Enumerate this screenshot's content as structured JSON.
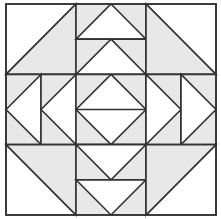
{
  "diagram": {
    "type": "quilt-block",
    "grid": {
      "rows": 3,
      "cols": 3
    },
    "origin": {
      "x": 6,
      "y": 4
    },
    "cell_size": {
      "w": 70,
      "h": 70.33
    },
    "colors": {
      "background": "#ffffff",
      "fill_light": "#ffffff",
      "fill_shaded": "#e8e8e8",
      "stroke": "#333333"
    },
    "stroke_width": 1.6,
    "cells": [
      {
        "row": 0,
        "col": 0,
        "kind": "half-square-triangle",
        "shaded_half": "bottom-right"
      },
      {
        "row": 0,
        "col": 1,
        "kind": "flying-geese-stack",
        "orientation": "vertical",
        "point": "up",
        "units": 2
      },
      {
        "row": 0,
        "col": 2,
        "kind": "half-square-triangle",
        "shaded_half": "bottom-left"
      },
      {
        "row": 1,
        "col": 0,
        "kind": "flying-geese-stack",
        "orientation": "horizontal",
        "point": "left",
        "units": 2
      },
      {
        "row": 1,
        "col": 1,
        "kind": "square-in-square",
        "split": "horizontal"
      },
      {
        "row": 1,
        "col": 2,
        "kind": "flying-geese-stack",
        "orientation": "horizontal",
        "point": "right",
        "units": 2
      },
      {
        "row": 2,
        "col": 0,
        "kind": "half-square-triangle",
        "shaded_half": "top-right"
      },
      {
        "row": 2,
        "col": 1,
        "kind": "flying-geese-stack",
        "orientation": "vertical",
        "point": "down",
        "units": 2
      },
      {
        "row": 2,
        "col": 2,
        "kind": "half-square-triangle",
        "shaded_half": "top-left"
      }
    ]
  }
}
